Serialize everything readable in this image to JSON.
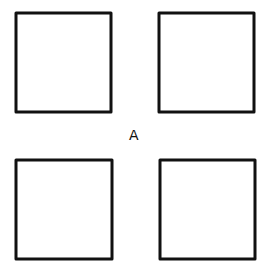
{
  "diagram": {
    "center_label": "A",
    "stroke_color": "#111111",
    "background": "#ffffff",
    "squares": [
      {
        "name": "top-left",
        "x": 16,
        "y": 13,
        "w": 95,
        "h": 99
      },
      {
        "name": "top-right",
        "x": 159,
        "y": 13,
        "w": 95,
        "h": 99
      },
      {
        "name": "bottom-left",
        "x": 16,
        "y": 160,
        "w": 96,
        "h": 99
      },
      {
        "name": "bottom-right",
        "x": 160,
        "y": 160,
        "w": 95,
        "h": 99
      }
    ]
  }
}
